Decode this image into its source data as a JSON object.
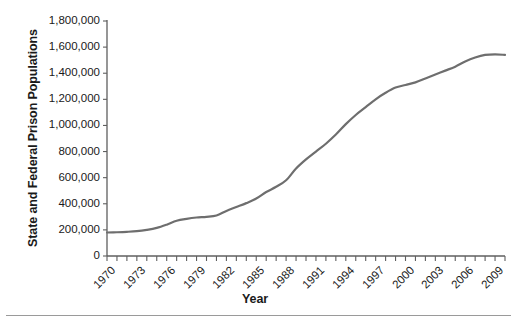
{
  "chart_data": {
    "type": "line",
    "title": "",
    "xlabel": "Year",
    "ylabel": "State and Federal Prison Populations",
    "xlim": [
      1970,
      2010
    ],
    "ylim": [
      0,
      1800000
    ],
    "grid": false,
    "legend": false,
    "line_color": "#6e6e6e",
    "line_width": 2.2,
    "y_ticks": [
      0,
      200000,
      400000,
      600000,
      800000,
      1000000,
      1200000,
      1400000,
      1600000,
      1800000
    ],
    "y_tick_labels": [
      "0",
      "200,000",
      "400,000",
      "600,000",
      "800,000",
      "1,000,000",
      "1,200,000",
      "1,400,000",
      "1,600,000",
      "1,800,000"
    ],
    "x_ticks": [
      1970,
      1973,
      1976,
      1979,
      1982,
      1985,
      1988,
      1991,
      1994,
      1997,
      2000,
      2003,
      2006,
      2009
    ],
    "x_tick_labels": [
      "1970",
      "1973",
      "1976",
      "1979",
      "1982",
      "1985",
      "1988",
      "1991",
      "1994",
      "1997",
      "2000",
      "2003",
      "2006",
      "2009"
    ],
    "x_minor_tick_interval": 1,
    "series": [
      {
        "name": "State and Federal Prison Populations",
        "x": [
          1970,
          1971,
          1972,
          1973,
          1974,
          1975,
          1976,
          1977,
          1978,
          1979,
          1980,
          1981,
          1982,
          1983,
          1984,
          1985,
          1986,
          1987,
          1988,
          1989,
          1990,
          1991,
          1992,
          1993,
          1994,
          1995,
          1996,
          1997,
          1998,
          1999,
          2000,
          2001,
          2002,
          2003,
          2004,
          2005,
          2006,
          2007,
          2008,
          2009,
          2010
        ],
        "values": [
          180000,
          182000,
          185000,
          190000,
          200000,
          215000,
          240000,
          270000,
          285000,
          295000,
          300000,
          310000,
          345000,
          375000,
          405000,
          440000,
          490000,
          530000,
          580000,
          670000,
          740000,
          800000,
          860000,
          930000,
          1010000,
          1080000,
          1140000,
          1200000,
          1250000,
          1290000,
          1310000,
          1330000,
          1360000,
          1390000,
          1420000,
          1450000,
          1490000,
          1520000,
          1540000,
          1545000,
          1540000
        ]
      }
    ]
  },
  "axis_titles": {
    "y": "State and Federal Prison Populations",
    "x": "Year"
  }
}
